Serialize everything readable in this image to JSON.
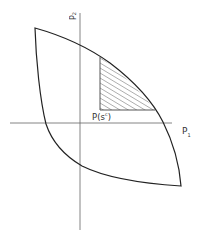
{
  "diagram": {
    "type": "utility possibility set",
    "axes": {
      "x_label": "P",
      "x_sub": "1",
      "y_label": "P",
      "y_sub": "2"
    },
    "point_label": "P(s",
    "point_sup": "c",
    "point_close": ")",
    "colors": {
      "stroke": "#222222",
      "axis": "#555555",
      "hatch": "#666666"
    }
  }
}
